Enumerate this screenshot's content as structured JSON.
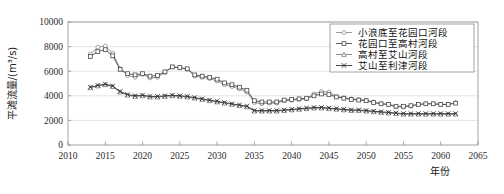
{
  "chart_data": {
    "type": "line",
    "title": "",
    "xlabel": "年份",
    "ylabel": "平滩流量/(m³/s)",
    "xlim": [
      2010,
      2065
    ],
    "ylim": [
      0,
      10000
    ],
    "xticks": [
      2010,
      2015,
      2020,
      2025,
      2030,
      2035,
      2040,
      2045,
      2050,
      2055,
      2060,
      2065
    ],
    "yticks": [
      0,
      2000,
      4000,
      6000,
      8000,
      10000
    ],
    "grid": "horizontal",
    "legend_position": "top-right",
    "x": [
      2013,
      2014,
      2015,
      2016,
      2017,
      2018,
      2019,
      2020,
      2021,
      2022,
      2023,
      2024,
      2025,
      2026,
      2027,
      2028,
      2029,
      2030,
      2031,
      2032,
      2033,
      2034,
      2035,
      2036,
      2037,
      2038,
      2039,
      2040,
      2041,
      2042,
      2043,
      2044,
      2045,
      2046,
      2047,
      2048,
      2049,
      2050,
      2051,
      2052,
      2053,
      2054,
      2055,
      2056,
      2057,
      2058,
      2059,
      2060,
      2061,
      2062
    ],
    "series": [
      {
        "name": "小浪底至花园口河段",
        "marker": "circle",
        "color": "#8a8a8a",
        "values": [
          7400,
          7950,
          8050,
          7450,
          6200,
          5650,
          5500,
          5750,
          5450,
          5500,
          5900,
          6350,
          6250,
          6150,
          5600,
          5500,
          5400,
          5200,
          4900,
          4750,
          4550,
          4300,
          3450,
          3350,
          3400,
          3400,
          3600,
          3650,
          3700,
          3750,
          4150,
          4350,
          4300,
          3950,
          3850,
          3750,
          3700,
          3650,
          3500,
          3350,
          3300,
          3100,
          3100,
          3150,
          3300,
          3350,
          3350,
          3300,
          3300,
          3450
        ]
      },
      {
        "name": "花园口至高村河段",
        "marker": "square",
        "color": "#4a4a4a",
        "values": [
          7200,
          7600,
          7750,
          7250,
          6150,
          5800,
          5700,
          5800,
          5600,
          5650,
          5950,
          6350,
          6300,
          6200,
          5700,
          5600,
          5500,
          5350,
          5050,
          4900,
          4700,
          4450,
          3600,
          3500,
          3500,
          3500,
          3650,
          3700,
          3750,
          3800,
          4000,
          4150,
          4100,
          3900,
          3800,
          3700,
          3650,
          3600,
          3450,
          3350,
          3300,
          3150,
          3150,
          3200,
          3300,
          3350,
          3350,
          3300,
          3300,
          3400
        ]
      },
      {
        "name": "高村至艾山河段",
        "marker": "triangle",
        "color": "#7a7a7a",
        "values": [
          4650,
          4800,
          4900,
          4750,
          4300,
          4050,
          3950,
          4000,
          3900,
          3900,
          3950,
          4000,
          3950,
          3900,
          3800,
          3700,
          3600,
          3500,
          3400,
          3300,
          3200,
          3100,
          2750,
          2750,
          2750,
          2750,
          2800,
          2850,
          2900,
          2950,
          3000,
          3000,
          2950,
          2900,
          2850,
          2800,
          2800,
          2750,
          2700,
          2650,
          2600,
          2550,
          2500,
          2500,
          2500,
          2500,
          2500,
          2500,
          2500,
          2500
        ]
      },
      {
        "name": "艾山至利津河段",
        "marker": "cross",
        "color": "#303030",
        "values": [
          4700,
          4850,
          4950,
          4800,
          4350,
          4100,
          4000,
          4050,
          3950,
          3950,
          4000,
          4050,
          4000,
          3950,
          3850,
          3750,
          3650,
          3550,
          3450,
          3350,
          3250,
          3150,
          2800,
          2800,
          2800,
          2800,
          2850,
          2900,
          2950,
          3000,
          3050,
          3050,
          3000,
          2950,
          2900,
          2850,
          2850,
          2800,
          2750,
          2700,
          2650,
          2600,
          2550,
          2550,
          2550,
          2550,
          2550,
          2550,
          2550,
          2550
        ]
      }
    ]
  },
  "legend": {
    "items": [
      {
        "label": "小浪底至花园口河段",
        "marker": "circle-marker-icon"
      },
      {
        "label": "花园口至高村河段",
        "marker": "square-marker-icon"
      },
      {
        "label": "高村至艾山河段",
        "marker": "triangle-marker-icon"
      },
      {
        "label": "艾山至利津河段",
        "marker": "cross-marker-icon"
      }
    ]
  },
  "axes": {
    "y_title": "平滩流量/(m³/s)",
    "x_title": "年份",
    "y_tick_labels": [
      "0",
      "2000",
      "4000",
      "6000",
      "8000",
      "10000"
    ],
    "x_tick_labels": [
      "2010",
      "2015",
      "2020",
      "2025",
      "2030",
      "2035",
      "2040",
      "2045",
      "2050",
      "2055",
      "2060",
      "2065"
    ]
  },
  "colors": {
    "frame": "#9a9a9a",
    "grid": "#d9d9d9",
    "background": "#ffffff"
  }
}
